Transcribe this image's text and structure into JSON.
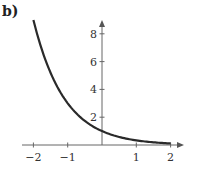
{
  "panel_label": "b)",
  "chart_data": {
    "type": "line",
    "title": "",
    "function": "y = 3^(-x)",
    "xlabel": "",
    "ylabel": "",
    "xlim": [
      -2,
      2
    ],
    "ylim": [
      0,
      9
    ],
    "grid": false,
    "legend": null,
    "x_ticks": [
      -2,
      -1,
      1,
      2
    ],
    "x_tick_labels": [
      "−2",
      "−1",
      "1",
      "2"
    ],
    "y_ticks": [
      2,
      4,
      6,
      8
    ],
    "y_tick_labels": [
      "2",
      "4",
      "6",
      "8"
    ],
    "series": [
      {
        "name": "y = 3^(-x)",
        "x": [
          -2,
          -1.5,
          -1,
          -0.5,
          0,
          0.5,
          1,
          1.5,
          2
        ],
        "values": [
          9,
          5.196,
          3,
          1.732,
          1,
          0.577,
          0.333,
          0.192,
          0.111
        ]
      }
    ]
  }
}
